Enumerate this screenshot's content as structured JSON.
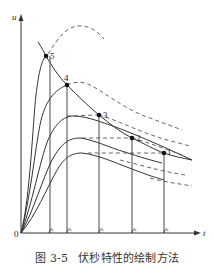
{
  "figure": {
    "axes": {
      "y_label": "u",
      "x_label": "t",
      "origin_label": "0"
    },
    "points": [
      {
        "label": "1",
        "x": 164,
        "y": 153
      },
      {
        "label": "2",
        "x": 132,
        "y": 138
      },
      {
        "label": "3",
        "x": 99,
        "y": 115
      },
      {
        "label": "4",
        "x": 67,
        "y": 85
      },
      {
        "label": "5",
        "x": 46,
        "y": 56
      }
    ],
    "caption": {
      "number": "图 3-5",
      "title": "伏秒特性的绘制方法"
    },
    "colors": {
      "line": "#333333",
      "dashed": "#555555",
      "background": "#ffffff"
    }
  }
}
